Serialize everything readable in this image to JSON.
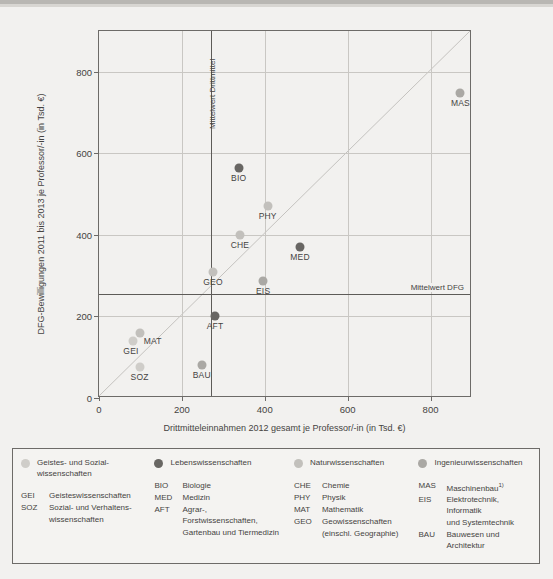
{
  "chart_data": {
    "type": "scatter",
    "title": "",
    "xlabel": "Drittmitteleinnahmen 2012 gesamt je Professor/-in (in Tsd. €)",
    "ylabel": "DFG-Bewilligungen 2011 bis 2013 je Professor/-in (in Tsd. €)",
    "xlim": [
      0,
      900
    ],
    "ylim": [
      0,
      900
    ],
    "xticks": [
      0,
      200,
      400,
      600,
      800
    ],
    "yticks": [
      0,
      200,
      400,
      600,
      800
    ],
    "grid": true,
    "legend_position": "bottom",
    "reference_lines": [
      {
        "name": "Mittelwert Drittmittel",
        "orientation": "vertical",
        "value": 270,
        "label": "Mittelwert Drittmittel"
      },
      {
        "name": "Mittelwert DFG",
        "orientation": "horizontal",
        "value": 255,
        "label": "Mittelwert DFG"
      },
      {
        "name": "Diagonale",
        "orientation": "diagonal",
        "label": ""
      }
    ],
    "points": [
      {
        "code": "BIO",
        "x": 337,
        "y": 563,
        "group": "Lebenswissenschaften",
        "label_pos": "below"
      },
      {
        "code": "PHY",
        "x": 407,
        "y": 470,
        "group": "Naturwissenschaften",
        "label_pos": "below"
      },
      {
        "code": "CHE",
        "x": 340,
        "y": 400,
        "group": "Naturwissenschaften",
        "label_pos": "below"
      },
      {
        "code": "MED",
        "x": 485,
        "y": 370,
        "group": "Lebenswissenschaften",
        "label_pos": "below"
      },
      {
        "code": "GEO",
        "x": 275,
        "y": 310,
        "group": "Naturwissenschaften",
        "label_pos": "below"
      },
      {
        "code": "EIS",
        "x": 396,
        "y": 288,
        "group": "Ingenieurwissenschaften",
        "label_pos": "below"
      },
      {
        "code": "AFT",
        "x": 280,
        "y": 200,
        "group": "Lebenswissenschaften",
        "label_pos": "below"
      },
      {
        "code": "MAT",
        "x": 98,
        "y": 160,
        "group": "Naturwissenschaften",
        "label_pos": "right-below"
      },
      {
        "code": "GEI",
        "x": 82,
        "y": 140,
        "group": "Geistes- und Sozialwissenschaften",
        "label_pos": "below-left"
      },
      {
        "code": "SOZ",
        "x": 98,
        "y": 75,
        "group": "Geistes- und Sozialwissenschaften",
        "label_pos": "below"
      },
      {
        "code": "BAU",
        "x": 248,
        "y": 80,
        "group": "Ingenieurwissenschaften",
        "label_pos": "below"
      },
      {
        "code": "MAS",
        "x": 872,
        "y": 748,
        "group": "Ingenieurwissenschaften",
        "label_pos": "below"
      }
    ],
    "group_colors": {
      "Geistes- und Sozialwissenschaften": "#cfcdc9",
      "Lebenswissenschaften": "#686663",
      "Naturwissenschaften": "#c2c0bc",
      "Ingenieurwissenschaften": "#aaa8a4"
    }
  },
  "axis": {
    "y_label": "DFG-Bewilligungen 2011 bis 2013 je Professor/-in (in Tsd. €)",
    "x_label": "Drittmitteleinnahmen 2012 gesamt je Professor/-in (in Tsd. €)",
    "x_ticks": [
      "0",
      "200",
      "400",
      "600",
      "800"
    ],
    "y_ticks": [
      "0",
      "200",
      "400",
      "600",
      "800"
    ]
  },
  "reference": {
    "vertical_label": "Mittelwert Drittmittel",
    "horizontal_label": "Mittelwert DFG"
  },
  "legend": {
    "columns": [
      {
        "title": "Geistes- und Sozial-\nwissenschaften",
        "title_line1": "Geistes- und Sozial-",
        "title_line2": "wissenschaften",
        "color": "#cfcdc9",
        "entries": [
          {
            "code": "GEI",
            "name": "Geisteswissenschaften"
          },
          {
            "code": "SOZ",
            "name": "Sozial- und Verhaltens-"
          },
          {
            "code": "",
            "name": "wissenschaften"
          }
        ]
      },
      {
        "title_line1": "Lebenswissenschaften",
        "title_line2": "",
        "color": "#686663",
        "entries": [
          {
            "code": "BIO",
            "name": "Biologie"
          },
          {
            "code": "MED",
            "name": "Medizin"
          },
          {
            "code": "AFT",
            "name": "Agrar-, Forstwissenschaften,"
          },
          {
            "code": "",
            "name": "Gartenbau und Tiermedizin"
          }
        ]
      },
      {
        "title_line1": "Naturwissenschaften",
        "title_line2": "",
        "color": "#c2c0bc",
        "entries": [
          {
            "code": "CHE",
            "name": "Chemie"
          },
          {
            "code": "PHY",
            "name": "Physik"
          },
          {
            "code": "MAT",
            "name": "Mathematik"
          },
          {
            "code": "GEO",
            "name": "Geowissenschaften"
          },
          {
            "code": "",
            "name": "(einschl. Geographie)"
          }
        ]
      },
      {
        "title_line1": "Ingenieurwissenschaften",
        "title_line2": "",
        "color": "#aaa8a4",
        "entries": [
          {
            "code": "MAS",
            "name": "Maschinenbau",
            "sup": "1)"
          },
          {
            "code": "EIS",
            "name": "Elektrotechnik, Informatik"
          },
          {
            "code": "",
            "name": "und Systemtechnik"
          },
          {
            "code": "BAU",
            "name": "Bauwesen und Architektur"
          }
        ]
      }
    ]
  }
}
